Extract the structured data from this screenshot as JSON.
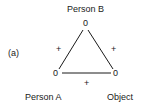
{
  "diagram": {
    "panel_label": "(a)",
    "nodes": {
      "top": {
        "label": "Person B",
        "value": "0"
      },
      "left": {
        "label": "Person A",
        "value": "0"
      },
      "right": {
        "label": "Object",
        "value": "0"
      }
    },
    "edges": {
      "left": {
        "from": "Person A",
        "to": "Person B",
        "sign": "+"
      },
      "right": {
        "from": "Person B",
        "to": "Object",
        "sign": "+"
      },
      "bottom": {
        "from": "Person A",
        "to": "Object",
        "sign": "+"
      }
    }
  }
}
